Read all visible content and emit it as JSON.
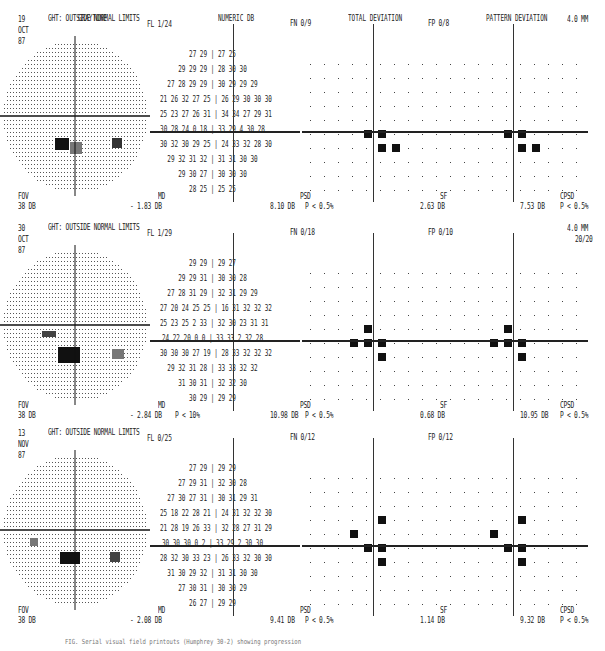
{
  "headers": {
    "graytone": "GRAYTONE",
    "numeric": "NUMERIC DB",
    "total": "TOTAL DEVIATION",
    "pattern": "PATTERN DEVIATION"
  },
  "tests": [
    {
      "day": "19",
      "month": "OCT",
      "year": "87",
      "ght": "GHT: OUTSIDE NORMAL LIMITS",
      "fl": "FL 1/24",
      "fn": "FN 0/9",
      "fp": "FP 0/8",
      "size": "4.0 MM",
      "acuity": "",
      "fov_label": "FOV",
      "fov_value": "38 DB",
      "md_label": "MD",
      "md_value": "- 1.83 DB",
      "md_p": "",
      "psd_label": "PSD",
      "psd_value": "8.10 DB",
      "psd_p": "P < 0.5%",
      "sf_label": "SF",
      "sf_value": "2.63 DB",
      "cpsd_label": "CPSD",
      "cpsd_value": "7.53 DB",
      "cpsd_p": "P < 0.5%",
      "numeric_rows": [
        "27 29 | 27 25",
        "29 29 29 | 28 30 30",
        "27 28 29 29 | 30 29 29 29",
        "21 26 32 27 25 | 26 29 30 30 30",
        "25 23 27 26 31 | 34 34 27 29 31",
        "30 28 24 0 18 | 33 29 4 30 28",
        "30 32 30 29 25 | 24 33 32 28 30",
        "29 32 31 32 | 31 31 30 30",
        "29 30 27 | 30 30 30",
        "28 25 | 25 25"
      ]
    },
    {
      "day": "30",
      "month": "OCT",
      "year": "87",
      "ght": "GHT: OUTSIDE NORMAL LIMITS",
      "fl": "FL 1/29",
      "fn": "FN 0/18",
      "fp": "FP 0/10",
      "size": "4.0 MM",
      "acuity": "20/20",
      "fov_label": "FOV",
      "fov_value": "38 DB",
      "md_label": "MD",
      "md_value": "- 2.84 DB",
      "md_p": "P < 10%",
      "psd_label": "PSD",
      "psd_value": "10.98 DB",
      "psd_p": "P < 0.5%",
      "sf_label": "SF",
      "sf_value": "0.68 DB",
      "cpsd_label": "CPSD",
      "cpsd_value": "10.95 DB",
      "cpsd_p": "P < 0.5%",
      "numeric_rows": [
        "29 29 | 29 27",
        "29 29 31 | 30 30 28",
        "27 28 31 29 | 32 31 29 29",
        "27 20 24 25 25 | 16 31 32 32 32",
        "25 23 25 2 33 | 32 30 23 31 31",
        "24 22 20 0 0 | 33 33 2 32 28",
        "30 30 30 27 19 | 28 33 32 32 32",
        "29 32 31 28 | 33 33 32 32",
        "31 30 31 | 32 32 30",
        "30 29 | 29 29"
      ]
    },
    {
      "day": "13",
      "month": "NOV",
      "year": "87",
      "ght": "GHT: OUTSIDE NORMAL LIMITS",
      "fl": "FL 0/25",
      "fn": "FN 0/12",
      "fp": "FP 0/12",
      "size": "",
      "acuity": "",
      "fov_label": "FOV",
      "fov_value": "38 DB",
      "md_label": "MD",
      "md_value": "- 2.08 DB",
      "md_p": "",
      "psd_label": "PSD",
      "psd_value": "9.41 DB",
      "psd_p": "P < 0.5%",
      "sf_label": "SF",
      "sf_value": "1.14 DB",
      "cpsd_label": "CPSD",
      "cpsd_value": "9.32 DB",
      "cpsd_p": "P < 0.5%",
      "numeric_rows": [
        "27 29 | 29 29",
        "27 29 31 | 32 30 28",
        "27 30 27 31 | 30 31 29 31",
        "25 18 22 28 21 | 24 31 32 32 30",
        "21 28 19 26 33 | 32 28 27 31 29",
        "30 30 30 0 2 | 33 29 2 30 30",
        "28 32 30 33 23 | 26 33 32 30 30",
        "31 30 29 32 | 31 31 30 30",
        "27 30 31 | 30 30 29",
        "26 27 | 29 29"
      ]
    }
  ],
  "caption": "FIG. Serial visual field printouts (Humphrey 30-2) showing progression"
}
